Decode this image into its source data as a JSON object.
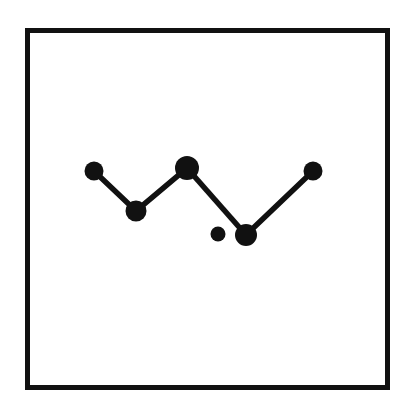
{
  "page": {
    "width": 414,
    "height": 413,
    "background_color": "#ffffff"
  },
  "frame": {
    "name": "square-border-frame",
    "x": 25,
    "y": 28,
    "width": 365,
    "height": 362,
    "stroke_color": "#111111",
    "stroke_width": 5,
    "fill_color": "#ffffff"
  },
  "chart_data": {
    "type": "scatter",
    "title": "",
    "subtitle": "",
    "xlabel": "",
    "ylabel": "",
    "grid": false,
    "legend": "none",
    "axis_visible": false,
    "xlim": [
      25,
      390
    ],
    "ylim": [
      28,
      390
    ],
    "marker_color": "#111111",
    "line_color": "#111111",
    "line_width": 5.5,
    "categories": [
      "p1",
      "p2",
      "p3",
      "p4",
      "p5",
      "p6"
    ],
    "points": [
      {
        "id": "p1",
        "x": 94,
        "y": 171,
        "r": 9.5,
        "connected": true,
        "label": ""
      },
      {
        "id": "p2",
        "x": 136,
        "y": 211,
        "r": 10.5,
        "connected": true,
        "label": ""
      },
      {
        "id": "p3",
        "x": 187,
        "y": 168,
        "r": 12.0,
        "connected": true,
        "label": ""
      },
      {
        "id": "p4",
        "x": 218,
        "y": 234,
        "r": 7.5,
        "connected": false,
        "label": ""
      },
      {
        "id": "p5",
        "x": 246,
        "y": 235,
        "r": 11.0,
        "connected": true,
        "label": ""
      },
      {
        "id": "p6",
        "x": 313,
        "y": 171,
        "r": 9.5,
        "connected": true,
        "label": ""
      }
    ],
    "series": [
      {
        "name": "zigzag-path",
        "point_ids": [
          "p1",
          "p2",
          "p3",
          "p5",
          "p6"
        ],
        "x": [
          94,
          136,
          187,
          246,
          313
        ],
        "values": [
          171,
          211,
          168,
          235,
          171
        ],
        "path": "M 100 178 L 131 203 M 143 205 L 179 176 M 195 177 L 239 227 M 255 227 L 307 180"
      }
    ],
    "annotations": [
      {
        "name": "isolated-point-note",
        "text": "unconnected point",
        "target": "p4"
      }
    ]
  }
}
